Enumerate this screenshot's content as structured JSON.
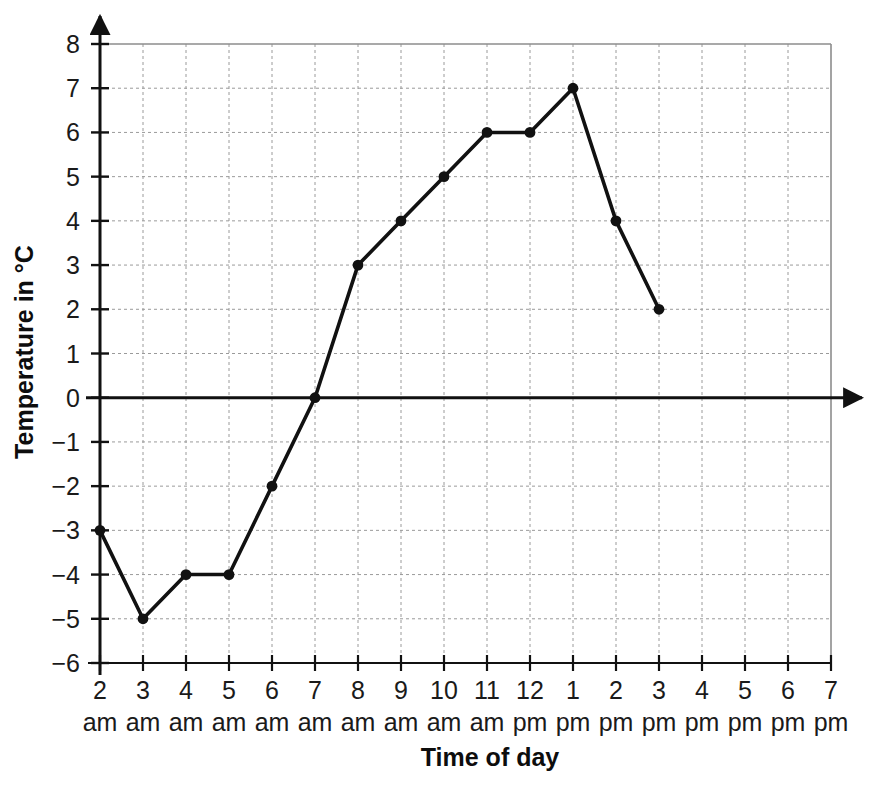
{
  "chart_data": {
    "type": "line",
    "title": "",
    "xlabel": "Time of day",
    "ylabel": "Temperature in °C",
    "x": [
      "2 am",
      "3 am",
      "4 am",
      "5 am",
      "6 am",
      "7 am",
      "8 am",
      "9 am",
      "10 am",
      "11 am",
      "12 pm",
      "1 pm",
      "2 pm",
      "3 pm"
    ],
    "x_tick_numbers": [
      "2",
      "3",
      "4",
      "5",
      "6",
      "7",
      "8",
      "9",
      "10",
      "11",
      "12",
      "1",
      "2",
      "3",
      "4",
      "5",
      "6",
      "7"
    ],
    "x_tick_meridiem": [
      "am",
      "am",
      "am",
      "am",
      "am",
      "am",
      "am",
      "am",
      "am",
      "am",
      "pm",
      "pm",
      "pm",
      "pm",
      "pm",
      "pm",
      "pm",
      "pm"
    ],
    "values": [
      -3,
      -5,
      -4,
      -4,
      -2,
      0,
      3,
      4,
      5,
      6,
      6,
      7,
      4,
      2
    ],
    "y_tick_labels": [
      "8",
      "7",
      "6",
      "5",
      "4",
      "3",
      "2",
      "1",
      "0",
      "−1",
      "−2",
      "−3",
      "−4",
      "−5",
      "−6"
    ],
    "y_tick_values": [
      8,
      7,
      6,
      5,
      4,
      3,
      2,
      1,
      0,
      -1,
      -2,
      -3,
      -4,
      -5,
      -6
    ],
    "ylim": [
      -6,
      8
    ],
    "xlim_labels": [
      "2 am",
      "7 pm"
    ],
    "grid": true,
    "legend": "none",
    "series": [
      {
        "name": "Temperature",
        "points": [
          {
            "time": "2 am",
            "value": -3
          },
          {
            "time": "3 am",
            "value": -5
          },
          {
            "time": "4 am",
            "value": -4
          },
          {
            "time": "5 am",
            "value": -4
          },
          {
            "time": "6 am",
            "value": -2
          },
          {
            "time": "7 am",
            "value": 0
          },
          {
            "time": "8 am",
            "value": 3
          },
          {
            "time": "9 am",
            "value": 4
          },
          {
            "time": "10 am",
            "value": 5
          },
          {
            "time": "11 am",
            "value": 6
          },
          {
            "time": "12 pm",
            "value": 6
          },
          {
            "time": "1 pm",
            "value": 7
          },
          {
            "time": "2 pm",
            "value": 4
          },
          {
            "time": "3 pm",
            "value": 2
          }
        ]
      }
    ],
    "colors": {
      "line": "#111111",
      "marker": "#111111",
      "grid": "#9a9a9a",
      "axis": "#111111",
      "frame": "#8c8c8c",
      "background": "#ffffff"
    }
  }
}
